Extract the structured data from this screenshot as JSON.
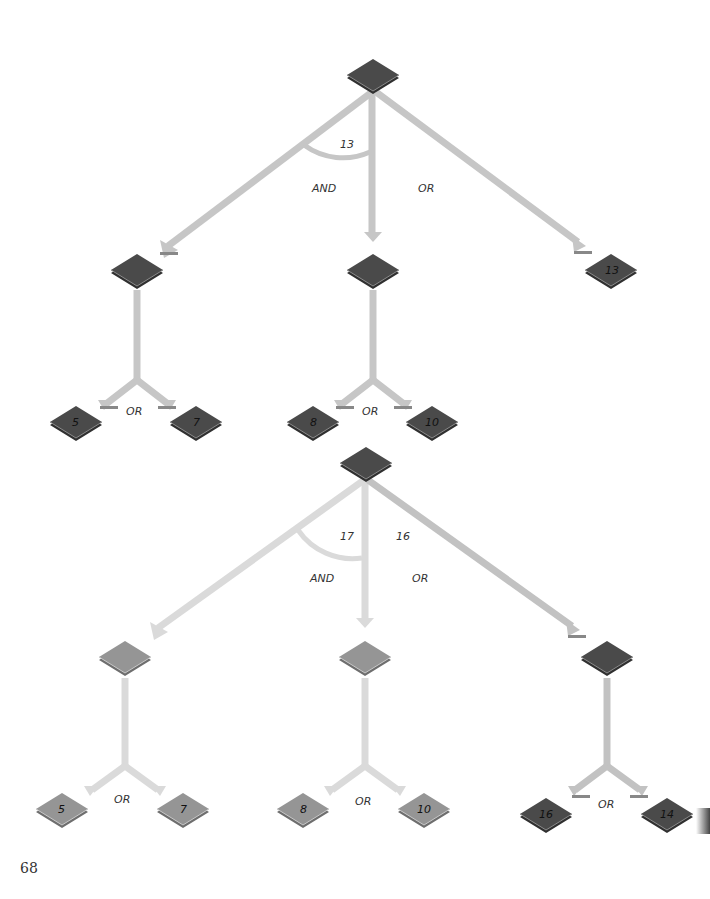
{
  "page_number": "68",
  "colors": {
    "node_dark": "#474747",
    "node_light": "#8f8f8f",
    "arrow": "#c4c4c4",
    "arrow_faded": "#dadada"
  },
  "tree1": {
    "root": {
      "label": ""
    },
    "and_arc_value": "13",
    "and_label": "AND",
    "or_label": "OR",
    "children": [
      {
        "label": "",
        "or_label": "OR",
        "leaves": [
          "5",
          "7"
        ]
      },
      {
        "label": "",
        "or_label": "OR",
        "leaves": [
          "8",
          "10"
        ]
      },
      {
        "label": "13"
      }
    ]
  },
  "tree2": {
    "root": {
      "label": ""
    },
    "and_arc_value": "17",
    "or_value": "16",
    "and_label": "AND",
    "or_label": "OR",
    "children": [
      {
        "label": "",
        "or_label": "OR",
        "leaves": [
          "5",
          "7"
        ]
      },
      {
        "label": "",
        "or_label": "OR",
        "leaves": [
          "8",
          "10"
        ]
      },
      {
        "label": "",
        "or_label": "OR",
        "leaves": [
          "16",
          "14"
        ]
      }
    ]
  }
}
